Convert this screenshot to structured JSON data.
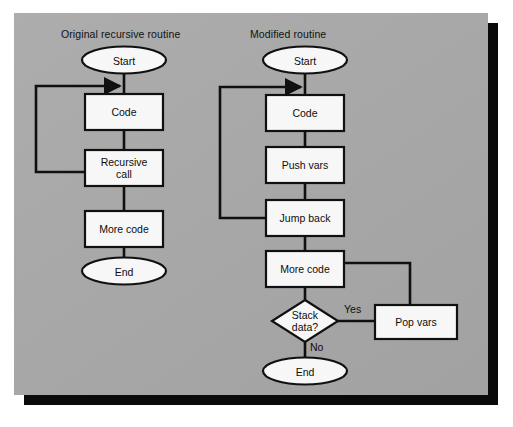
{
  "figure": {
    "panel_color": "#a9a9a9",
    "shadow_color": "#0a0a0a",
    "node_fill": "#f7f7f7",
    "stroke_color": "#101010"
  },
  "columns": [
    {
      "id": "original",
      "title": "Original recursive routine",
      "nodes": [
        {
          "id": "orig-start",
          "label": "Start",
          "shape": "ellipse"
        },
        {
          "id": "orig-code",
          "label": "Code",
          "shape": "rect"
        },
        {
          "id": "orig-recursive",
          "label": "Recursive\ncall",
          "shape": "rect"
        },
        {
          "id": "orig-morecode",
          "label": "More code",
          "shape": "rect"
        },
        {
          "id": "orig-end",
          "label": "End",
          "shape": "ellipse"
        }
      ],
      "edge_labels": []
    },
    {
      "id": "modified",
      "title": "Modified routine",
      "nodes": [
        {
          "id": "mod-start",
          "label": "Start",
          "shape": "ellipse"
        },
        {
          "id": "mod-code",
          "label": "Code",
          "shape": "rect"
        },
        {
          "id": "mod-push",
          "label": "Push vars",
          "shape": "rect"
        },
        {
          "id": "mod-jump",
          "label": "Jump back",
          "shape": "rect"
        },
        {
          "id": "mod-morecode",
          "label": "More code",
          "shape": "rect"
        },
        {
          "id": "mod-stack",
          "label": "Stack\ndata?",
          "shape": "diamond"
        },
        {
          "id": "mod-pop",
          "label": "Pop vars",
          "shape": "rect"
        },
        {
          "id": "mod-end",
          "label": "End",
          "shape": "ellipse"
        }
      ],
      "edge_labels": [
        {
          "id": "yes-label",
          "label": "Yes"
        },
        {
          "id": "no-label",
          "label": "No"
        }
      ]
    }
  ]
}
